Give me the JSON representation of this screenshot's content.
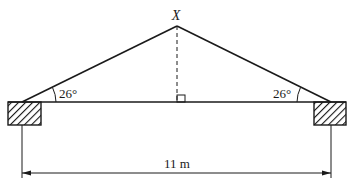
{
  "diagram": {
    "type": "roof-truss",
    "apex_label": "X",
    "left_angle_label": "26°",
    "right_angle_label": "26°",
    "span_label": "11 m",
    "right_angle_marker": true,
    "supports": [
      "left-wall",
      "right-wall"
    ],
    "colors": {
      "line": "#1a1a1a",
      "background": "#ffffff"
    }
  }
}
